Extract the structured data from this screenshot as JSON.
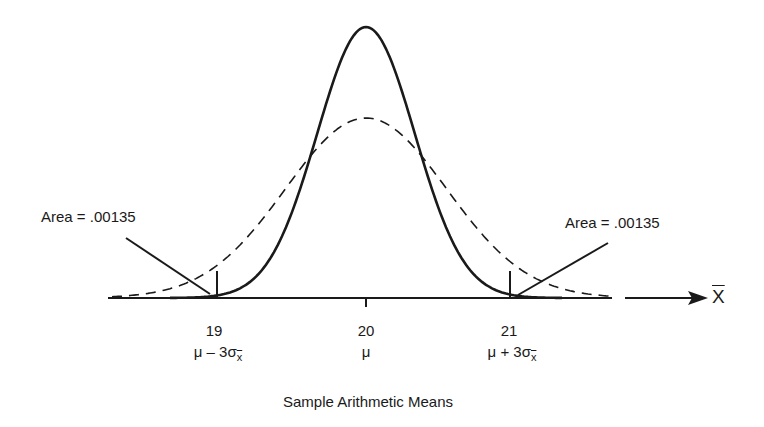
{
  "chart_data": {
    "type": "line",
    "title": "",
    "xlabel": "Sample Arithmetic Means",
    "axis_symbol": "X̄",
    "series": [
      {
        "name": "Sampling distribution of the mean (solid)",
        "style": "solid",
        "mean": 20,
        "sd": 0.3333
      },
      {
        "name": "Population distribution (dashed)",
        "style": "dashed",
        "mean": 20,
        "sd": 0.55
      }
    ],
    "ticks": [
      {
        "value": 19,
        "label": "19",
        "sublabel": "μ − 3σ"
      },
      {
        "value": 20,
        "label": "20",
        "sublabel": "μ"
      },
      {
        "value": 21,
        "label": "21",
        "sublabel": "μ + 3σ"
      }
    ],
    "annotations": [
      {
        "text": "Area = .00135",
        "side": "left",
        "points_to": "tail below 19"
      },
      {
        "text": "Area = .00135",
        "side": "right",
        "points_to": "tail above 21"
      }
    ],
    "grid": false,
    "legend": "none"
  },
  "labels": {
    "area_left": "Area = .00135",
    "area_right": "Area = .00135",
    "tick_19": "19",
    "tick_20": "20",
    "tick_21": "21",
    "sub_19_prefix": "μ – 3σ",
    "sub_20": "μ",
    "sub_21_prefix": "μ + 3σ",
    "sigma_subscript": "x",
    "axis_symbol": "X",
    "xlabel": "Sample Arithmetic Means"
  }
}
